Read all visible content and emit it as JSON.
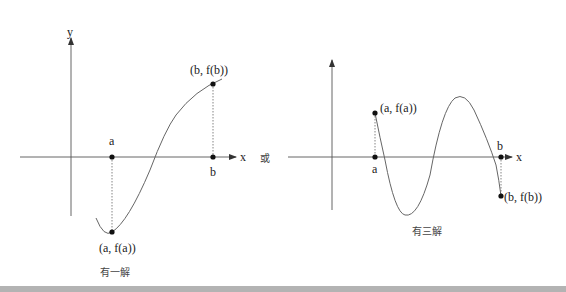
{
  "left_graph": {
    "y_axis_label": "y",
    "x_axis_label": "x",
    "point_a_label": "a",
    "point_b_label": "b",
    "point_fa_label": "(a, f(a))",
    "point_fb_label": "(b, f(b))",
    "caption": "有一解"
  },
  "separator": "或",
  "right_graph": {
    "x_axis_label": "x",
    "point_a_label": "a",
    "point_b_label": "b",
    "point_fa_label": "(a, f(a))",
    "point_fb_label": "(b, f(b))",
    "caption": "有三解"
  },
  "colors": {
    "axis": "#555555",
    "curve": "#666666",
    "text": "#222222",
    "bottom_bar": "#b3b3b3"
  }
}
